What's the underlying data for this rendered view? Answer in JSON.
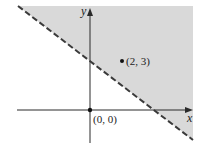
{
  "figure": {
    "type": "linear-inequality-graph",
    "axes": {
      "x_label": "x",
      "y_label": "y"
    },
    "boundary": {
      "style": "dashed",
      "description": "dashed boundary line with negative slope crossing positive y-axis and positive x-axis"
    },
    "shaded_region": "half-plane above the dashed line",
    "points": [
      {
        "label": "(2, 3)",
        "x": 2,
        "y": 3,
        "in_region": true
      },
      {
        "label": "(0, 0)",
        "x": 0,
        "y": 0,
        "in_region": false
      }
    ]
  },
  "colors": {
    "shade": "#d9d9d9",
    "line": "#3a3a3a",
    "axis": "#2a2a2a",
    "point": "#111111"
  }
}
